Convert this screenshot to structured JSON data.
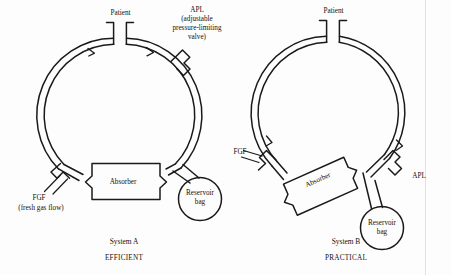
{
  "figure": {
    "background_color": "#fdfdfd",
    "ink_color": "#1a1a1a",
    "gutter_line_color": "#e2e2e2",
    "systems": [
      {
        "id": "system-a",
        "caption": "System A",
        "verdict": "EFFICIENT",
        "circle": {
          "cx": 120,
          "cy": 115,
          "r_outer": 77,
          "r_inner": 71
        },
        "labels": {
          "patient": "Patient",
          "apl": "APL",
          "apl_expansion_line1": "(adjustable",
          "apl_expansion_line2": "pressure-limiting",
          "apl_expansion_line3": "valve)",
          "fgf": "FGF",
          "fgf_expansion": "(fresh gas flow)",
          "absorber": "Absorber",
          "reservoir_line1": "Reservoir",
          "reservoir_line2": "bag"
        }
      },
      {
        "id": "system-b",
        "caption": "System B",
        "verdict": "PRACTICAL",
        "circle": {
          "cx": 333,
          "cy": 113,
          "r_outer": 77,
          "r_inner": 71
        },
        "labels": {
          "patient": "Patient",
          "apl": "APL",
          "fgf": "FGF",
          "absorber": "Absorber",
          "reservoir_line1": "Reservoir",
          "reservoir_line2": "bag"
        }
      }
    ],
    "components": [
      "patient-y-piece",
      "inspiratory-one-way-valve",
      "expiratory-one-way-valve",
      "apl-valve",
      "soda-lime-absorber",
      "fresh-gas-flow-inlet",
      "reservoir-bag"
    ]
  }
}
